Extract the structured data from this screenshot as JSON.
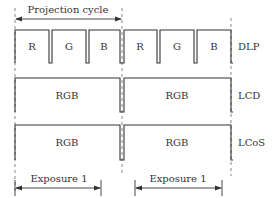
{
  "diagram": {
    "top_arrow": {
      "label": "Projection cycle"
    },
    "rows": [
      {
        "name": "DLP",
        "segments": [
          "R",
          "G",
          "B",
          "R",
          "G",
          "B"
        ]
      },
      {
        "name": "LCD",
        "segments": [
          "RGB",
          "RGB"
        ]
      },
      {
        "name": "LCoS",
        "segments": [
          "RGB",
          "RGB"
        ]
      }
    ],
    "bottom_arrows": [
      {
        "label": "Exposure 1"
      },
      {
        "label": "Exposure 1"
      }
    ],
    "colors": {
      "line": "#333333",
      "background": "#ffffff"
    }
  }
}
